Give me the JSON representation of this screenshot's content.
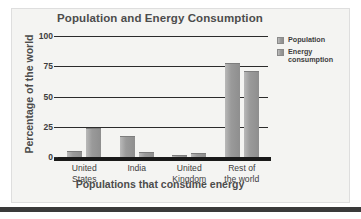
{
  "chart_data": {
    "type": "bar",
    "title": "Population and Energy Consumption",
    "xlabel": "Populations that consume energy",
    "ylabel": "Percentage of the world",
    "categories": [
      "United States",
      "India",
      "United Kingdom",
      "Rest of the world"
    ],
    "category_lines": [
      [
        "United",
        "States"
      ],
      [
        "India",
        ""
      ],
      [
        "United",
        "Kingdom"
      ],
      [
        "Rest of",
        "the world"
      ]
    ],
    "series": [
      {
        "name": "Population",
        "values": [
          5,
          17,
          2,
          78
        ],
        "color": "#9a9a9a"
      },
      {
        "name": "Energy consumption",
        "values": [
          24,
          4,
          3,
          71
        ],
        "color": "#9a9a9a"
      }
    ],
    "legend": [
      {
        "label": "Population",
        "lines": [
          "Population"
        ]
      },
      {
        "label": "Energy consumption",
        "lines": [
          "Energy",
          "consumption"
        ]
      }
    ],
    "ylim": [
      0,
      100
    ],
    "yticks": [
      0,
      25,
      50,
      75,
      100
    ],
    "ytick_labels": [
      "0",
      "25",
      "50",
      "75",
      "100"
    ],
    "grid": true,
    "legend_position": "right"
  },
  "colors": {
    "panel_background": "#f4f4f2",
    "panel_border": "#dedede",
    "axis": "#2b2b2b",
    "baseline": "#1a1a1a",
    "title_text": "#4c4c4c",
    "tick_text": "#3d3d3d",
    "bar_fill": "#9a9a9a"
  }
}
